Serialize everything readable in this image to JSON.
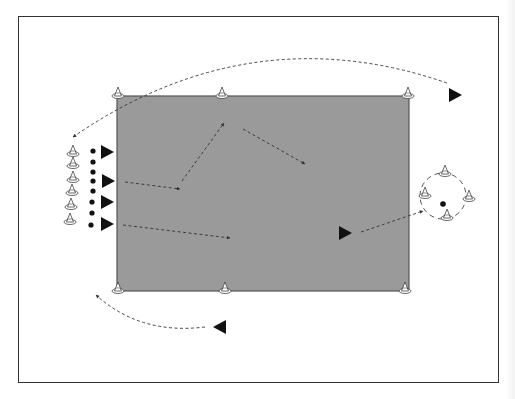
{
  "diagram": {
    "type": "sports-drill",
    "colors": {
      "field": "#9a9a9a",
      "field_border": "#555555",
      "frame": "#333333",
      "player": "#111111",
      "arrow": "#333333",
      "cone_stroke": "#444444",
      "cone_fill": "#ffffff"
    },
    "field": {
      "x": 117,
      "y": 96,
      "width": 292,
      "height": 195
    },
    "corner_cones": [
      {
        "x": 118,
        "y": 96
      },
      {
        "x": 222,
        "y": 96
      },
      {
        "x": 408,
        "y": 96
      },
      {
        "x": 118,
        "y": 291
      },
      {
        "x": 225,
        "y": 291
      },
      {
        "x": 405,
        "y": 291
      }
    ],
    "queue_cones": [
      {
        "x": 73,
        "y": 154
      },
      {
        "x": 73,
        "y": 166
      },
      {
        "x": 73,
        "y": 180
      },
      {
        "x": 72,
        "y": 193
      },
      {
        "x": 71,
        "y": 207
      },
      {
        "x": 70,
        "y": 222
      }
    ],
    "queue_balls": [
      {
        "x": 93,
        "y": 151
      },
      {
        "x": 93,
        "y": 162
      },
      {
        "x": 93,
        "y": 172
      },
      {
        "x": 93,
        "y": 181
      },
      {
        "x": 93,
        "y": 191
      },
      {
        "x": 92,
        "y": 202
      },
      {
        "x": 92,
        "y": 213
      },
      {
        "x": 91,
        "y": 225
      }
    ],
    "players": [
      {
        "x": 107,
        "y": 152,
        "dir": "right"
      },
      {
        "x": 108,
        "y": 181,
        "dir": "right"
      },
      {
        "x": 107,
        "y": 202,
        "dir": "right"
      },
      {
        "x": 107,
        "y": 224,
        "dir": "right"
      },
      {
        "x": 345,
        "y": 233,
        "dir": "right"
      },
      {
        "x": 455,
        "y": 95,
        "dir": "right"
      },
      {
        "x": 220,
        "y": 327,
        "dir": "left"
      }
    ],
    "goal_circle": {
      "cx": 443,
      "cy": 196,
      "rx": 23,
      "ry": 23
    },
    "goal_cones": [
      {
        "x": 445,
        "y": 174
      },
      {
        "x": 425,
        "y": 196
      },
      {
        "x": 469,
        "y": 199
      },
      {
        "x": 447,
        "y": 218
      }
    ],
    "goal_ball": {
      "x": 443,
      "y": 204
    },
    "paths": [
      {
        "d": "M 447 83 Q 250 15 73 137",
        "label": "top-return-run"
      },
      {
        "d": "M 205 327 Q 140 335 96 295",
        "label": "bottom-return-run"
      },
      {
        "d": "M 125 182 L 180 189",
        "label": "pass-1"
      },
      {
        "d": "M 182 181 L 224 123",
        "label": "pass-2"
      },
      {
        "d": "M 243 129 L 305 164",
        "label": "pass-3"
      },
      {
        "d": "M 123 225 L 230 238",
        "label": "pass-4"
      },
      {
        "d": "M 361 232 L 423 211",
        "label": "shot-to-goal"
      }
    ]
  }
}
